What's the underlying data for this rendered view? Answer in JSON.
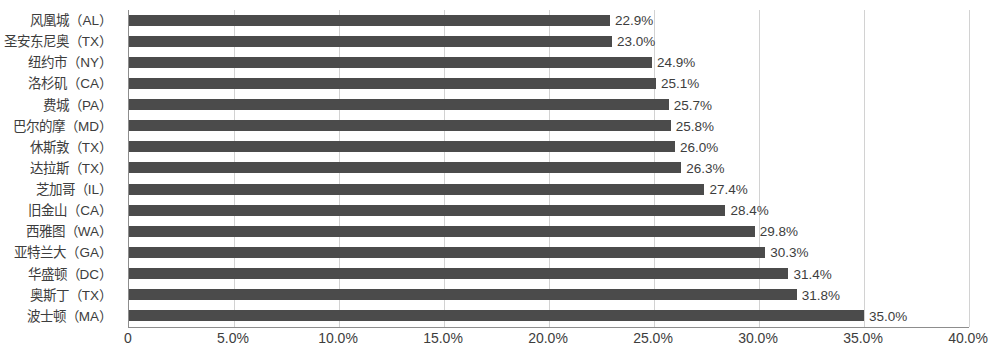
{
  "chart_data": {
    "type": "bar",
    "orientation": "horizontal",
    "title": "",
    "subtitle": "",
    "xlabel": "",
    "ylabel": "",
    "xlim": [
      0,
      40
    ],
    "grid": true,
    "legend": false,
    "value_format": "percent",
    "value_suffix": "%",
    "categories": [
      "风凰城（AL）",
      "圣安东尼奥（TX）",
      "纽约市（NY）",
      "洛杉矶（CA）",
      "费城（PA）",
      "巴尔的摩（MD）",
      "休斯敦（TX）",
      "达拉斯（TX）",
      "芝加哥（IL）",
      "旧金山（CA）",
      "西雅图（WA）",
      "亚特兰大（GA）",
      "华盛顿（DC）",
      "奥斯丁（TX）",
      "波士顿（MA）"
    ],
    "values": [
      22.9,
      23.0,
      24.9,
      25.1,
      25.7,
      25.8,
      26.0,
      26.3,
      27.4,
      28.4,
      29.8,
      30.3,
      31.4,
      31.8,
      35.0
    ],
    "data_labels": [
      "22.9%",
      "23.0%",
      "24.9%",
      "25.1%",
      "25.7%",
      "25.8%",
      "26.0%",
      "26.3%",
      "27.4%",
      "28.4%",
      "29.8%",
      "30.3%",
      "31.4%",
      "31.8%",
      "35.0%"
    ],
    "xticks": [
      0,
      5,
      10,
      15,
      20,
      25,
      30,
      35,
      40
    ],
    "xtick_labels": [
      "0",
      "5.0%",
      "10.0%",
      "15.0%",
      "20.0%",
      "25.0%",
      "30.0%",
      "35.0%",
      "40.0%"
    ],
    "colors": {
      "bar": "#4b4b4b",
      "gridline": "#d2d2d2",
      "axis": "#8d8d8d",
      "text": "#3d3d3d",
      "background": "#ffffff"
    }
  }
}
